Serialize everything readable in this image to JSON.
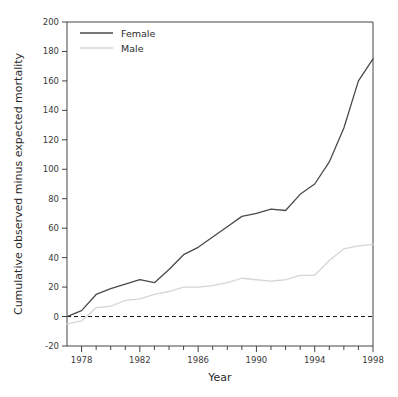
{
  "chart_data": {
    "type": "line",
    "title": "",
    "xlabel": "Year",
    "ylabel": "Cumulative observed minus expected mortality",
    "xlim": [
      1977,
      1998
    ],
    "ylim": [
      -20,
      200
    ],
    "xticks_major": [
      1978,
      1982,
      1986,
      1990,
      1994,
      1998
    ],
    "xticks_minor_step": 1,
    "yticks": [
      -20,
      0,
      20,
      40,
      60,
      80,
      100,
      120,
      140,
      160,
      180,
      200
    ],
    "grid": false,
    "legend_position": "top-left",
    "zero_reference_line": {
      "value": 0,
      "style": "dashed"
    },
    "x": [
      1977,
      1978,
      1979,
      1980,
      1981,
      1982,
      1983,
      1984,
      1985,
      1986,
      1987,
      1988,
      1989,
      1990,
      1991,
      1992,
      1993,
      1994,
      1995,
      1996,
      1997,
      1998
    ],
    "series": [
      {
        "name": "Female",
        "color": "#4a4a4a",
        "values": [
          0,
          4,
          15,
          19,
          22,
          25,
          23,
          32,
          42,
          47,
          54,
          61,
          68,
          70,
          73,
          72,
          83,
          90,
          105,
          128,
          160,
          175
        ]
      },
      {
        "name": "Male",
        "color": "#d6d6d6",
        "values": [
          -5,
          -3,
          6,
          7,
          11,
          12,
          15,
          17,
          20,
          20,
          21,
          23,
          26,
          25,
          24,
          25,
          28,
          28,
          38,
          46,
          48,
          49
        ]
      }
    ]
  },
  "axes": {
    "xlabel": "Year",
    "ylabel": "Cumulative observed minus expected mortality",
    "xtick_labels": [
      "1978",
      "1982",
      "1986",
      "1990",
      "1994",
      "1998"
    ],
    "ytick_labels": [
      "200",
      "180",
      "160",
      "140",
      "120",
      "100",
      "80",
      "60",
      "40",
      "20",
      "0",
      "-20"
    ]
  },
  "legend": {
    "entries": [
      {
        "label": "Female",
        "color": "#4a4a4a"
      },
      {
        "label": "Male",
        "color": "#d6d6d6"
      }
    ]
  },
  "colors": {
    "female": "#4a4a4a",
    "male": "#d6d6d6",
    "axis": "#444444",
    "text": "#2b2b2b",
    "background": "#ffffff"
  }
}
